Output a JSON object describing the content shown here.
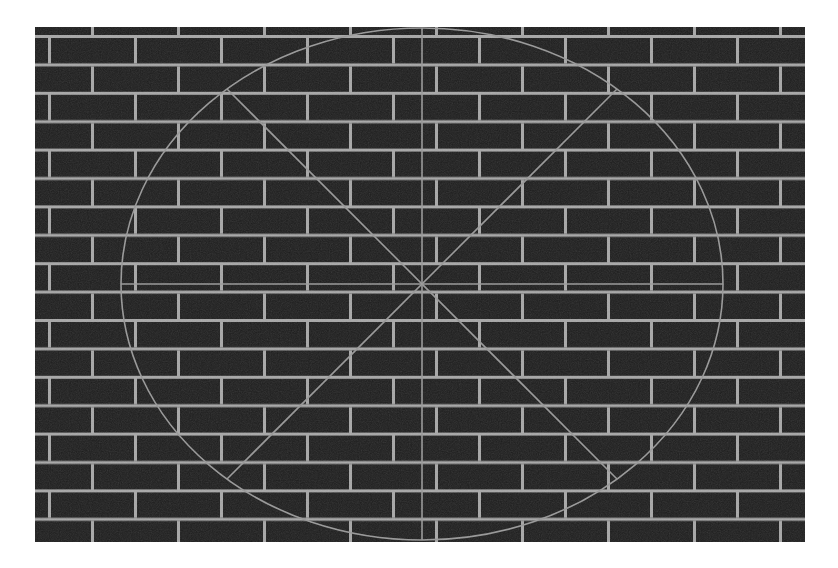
{
  "figure": {
    "type": "brick-wall-pattern-figure",
    "canvas": {
      "width": 838,
      "height": 568,
      "background": "#ffffff"
    },
    "wall": {
      "left": 35,
      "top": 27,
      "width": 770,
      "height": 515,
      "brick_color": "#1d1d1d",
      "mortar_color": "#a7a7a7",
      "brick_width": 86,
      "row_height": 28.4,
      "joint_thickness": 3,
      "pattern_offset_x": 13,
      "pattern_offset_y": 8
    },
    "overlay": {
      "stroke_color": "#989898",
      "stroke_width": 1.6,
      "ellipse": {
        "cx": 387,
        "cy": 257,
        "rx": 301,
        "ry": 256
      },
      "diagonals": [
        {
          "x1": 192,
          "y1": 62,
          "x2": 582,
          "y2": 452
        },
        {
          "x1": 192,
          "y1": 452,
          "x2": 582,
          "y2": 62
        }
      ],
      "vertical_diameter": {
        "x1": 387,
        "y1": 1,
        "x2": 387,
        "y2": 513
      },
      "horizontal_diameter": {
        "x1": 86,
        "y1": 257,
        "x2": 688,
        "y2": 257
      }
    },
    "noise": {
      "opacity": 0.16,
      "base_frequency": 0.9
    }
  }
}
